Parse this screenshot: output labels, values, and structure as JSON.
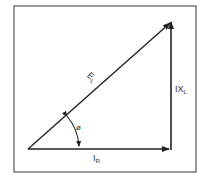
{
  "diagram": {
    "type": "phasor-impedance-triangle",
    "frame": {
      "x": 14,
      "y": 6,
      "width": 182,
      "height": 166,
      "color": "#555555"
    },
    "line_color": "#222222",
    "vectors": [
      {
        "name": "resistive-voltage",
        "label": "I",
        "subscript": "R",
        "from": [
          28,
          149
        ],
        "to": [
          169,
          149
        ]
      },
      {
        "name": "reactive-voltage",
        "label": "IX",
        "subscript": "L",
        "from": [
          171,
          149
        ],
        "to": [
          171,
          22
        ]
      },
      {
        "name": "applied-voltage",
        "label": "E",
        "subscript": "L",
        "from": [
          28,
          149
        ],
        "to": [
          171,
          22
        ]
      }
    ],
    "angle": {
      "symbol": "ø",
      "name": "phase-angle"
    },
    "labels": {
      "hypotenuse_main": "E",
      "hypotenuse_sub": "L",
      "vertical_main": "IX",
      "vertical_sub": "L",
      "horizontal_main": "I",
      "horizontal_sub": "R",
      "angle": "ø"
    }
  }
}
